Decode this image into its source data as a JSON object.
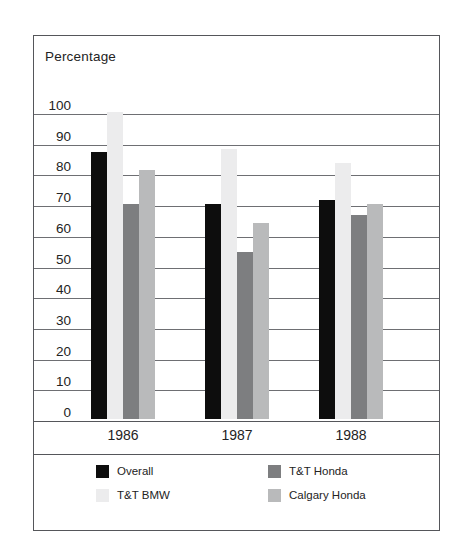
{
  "figure": {
    "axis_title": "Percentage"
  },
  "chart_data": {
    "type": "bar",
    "title": "",
    "subtitle": "",
    "xlabel": "",
    "ylabel": "Percentage",
    "categories": [
      "1986",
      "1987",
      "1988"
    ],
    "series": [
      {
        "name": "Overall",
        "color": "#0d0d0d",
        "values": [
          87,
          70,
          71.5
        ]
      },
      {
        "name": "T&T BMW",
        "color": "#ececed",
        "values": [
          100,
          88,
          83.5
        ]
      },
      {
        "name": "T&T Honda",
        "color": "#7d7e80",
        "values": [
          70,
          54.5,
          66.5
        ]
      },
      {
        "name": "Calgary Honda",
        "color": "#b9babb",
        "values": [
          81,
          64,
          70
        ]
      }
    ],
    "ylim": [
      0,
      100
    ],
    "ytick_step": 10,
    "yticks": [
      "0",
      "10",
      "20",
      "30",
      "40",
      "50",
      "60",
      "70",
      "80",
      "90",
      "100"
    ],
    "grid": true,
    "grid_axis": "y",
    "legend_position": "bottom",
    "bar_group_order": [
      "Overall",
      "T&T BMW",
      "T&T Honda",
      "Calgary Honda"
    ]
  },
  "legend": {
    "entries": [
      {
        "label": "Overall",
        "color": "#0d0d0d"
      },
      {
        "label": "T&T Honda",
        "color": "#7d7e80"
      },
      {
        "label": "T&T BMW",
        "color": "#ececed"
      },
      {
        "label": "Calgary Honda",
        "color": "#b9babb"
      }
    ]
  }
}
